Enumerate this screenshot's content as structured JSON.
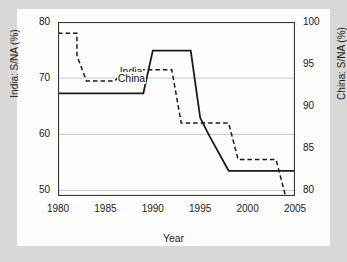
{
  "figure": {
    "background_color": "#d8d8d6",
    "canvas_color": "#fdfdfc",
    "frame_color": "#3a3a3a",
    "grid_color": "#c9c9c9"
  },
  "chart_data": {
    "type": "line",
    "title": "",
    "subtitle": "",
    "xlabel": "Year",
    "ylabel": "India: S/NA (%)",
    "ylabel_right": "China: S/NA (%)",
    "xlim": [
      1980,
      2005
    ],
    "ylim": [
      49,
      80
    ],
    "ylim_right": [
      79.3,
      100
    ],
    "xticks": [
      1980,
      1985,
      1990,
      1995,
      2000,
      2005
    ],
    "xticklabels": [
      "1980",
      "1985",
      "1990",
      "1995",
      "2000",
      "2005"
    ],
    "yticks": [
      50,
      60,
      70,
      80
    ],
    "yticklabels": [
      "50",
      "60",
      "70",
      "80"
    ],
    "yticks_right": [
      80,
      85,
      90,
      95,
      100
    ],
    "yticklabels_right": [
      "80",
      "85",
      "90",
      "95",
      "100"
    ],
    "grid": true,
    "grid_axis": "y",
    "legend": "inline-labels",
    "series": [
      {
        "name": "India",
        "axis": "left",
        "style": "dashed",
        "color": "#1b1b1b",
        "label_text": "India",
        "x": [
          1980,
          1982,
          1982,
          1983,
          1986,
          1987,
          1992,
          1993,
          1998,
          1999,
          2003,
          2004,
          2005
        ],
        "values": [
          78.0,
          78.0,
          74.0,
          69.5,
          69.5,
          71.5,
          71.5,
          62.0,
          62.0,
          55.5,
          55.5,
          49.0,
          49.0
        ]
      },
      {
        "name": "China",
        "axis": "right",
        "style": "solid",
        "color": "#1b1b1b",
        "label_text": "China",
        "x": [
          1980,
          1989,
          1990,
          1994,
          1995,
          1996,
          1998,
          2005
        ],
        "values": [
          91.5,
          91.5,
          96.6,
          96.6,
          88.6,
          86.4,
          82.3,
          82.3
        ]
      }
    ]
  }
}
